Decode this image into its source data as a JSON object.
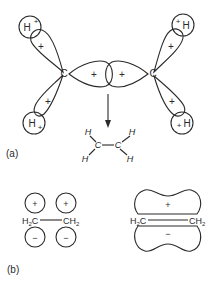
{
  "figure": {
    "part_a": {
      "label": "(a)",
      "atoms": {
        "carbon_left": "C",
        "carbon_right": "C",
        "hydrogen": "H"
      },
      "signs": {
        "plus": "+",
        "minus": "−"
      },
      "ethylene": {
        "h": "H",
        "c": "C"
      }
    },
    "part_b": {
      "label": "(b)",
      "left": {
        "h2c": "H",
        "h2c_sub": "2",
        "h2c_c": "C",
        "ch2_c": "CH",
        "ch2_sub": "2"
      },
      "right": {
        "h2c": "H",
        "h2c_sub": "2",
        "h2c_c": "C",
        "ch2_c": "CH",
        "ch2_sub": "2"
      }
    }
  },
  "colors": {
    "ink": "#2a2a2a",
    "background": "#ffffff"
  }
}
